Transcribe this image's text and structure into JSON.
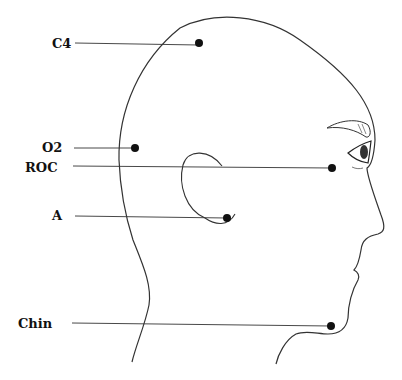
{
  "diagram": {
    "title": "",
    "electrodes": [
      {
        "label": "C4",
        "label_x": 26,
        "label_y": 37,
        "line_x1": 75,
        "line_y1": 43,
        "dot_x": 199,
        "dot_y": 43
      },
      {
        "label": "O2",
        "label_x": 25,
        "label_y": 141,
        "line_x1": 74,
        "line_y1": 148,
        "dot_x": 135,
        "dot_y": 148
      },
      {
        "label": "ROC",
        "label_x": 25,
        "label_y": 161,
        "line_x1": 73,
        "line_y1": 166,
        "dot_x": 332,
        "dot_y": 168
      },
      {
        "label": "A",
        "label_x": 51,
        "label_y": 209,
        "line_x1": 75,
        "line_y1": 216,
        "dot_x": 227,
        "dot_y": 218
      },
      {
        "label": "Chin",
        "label_x": 18,
        "label_y": 317,
        "line_x1": 72,
        "line_y1": 323,
        "dot_x": 331,
        "dot_y": 326
      }
    ],
    "colors": {
      "line": "#333333",
      "dot": "#111111",
      "label": "#111111"
    }
  }
}
